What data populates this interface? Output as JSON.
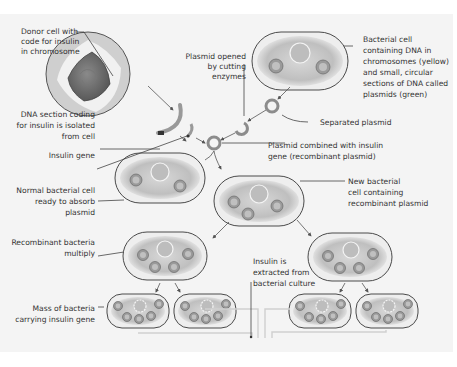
{
  "diagram": {
    "labels": {
      "donor_cell": [
        "Donor cell with",
        "code for insulin",
        "in chromosome"
      ],
      "plasmid_opened": [
        "Plasmid opened",
        "by cutting",
        "enzymes"
      ],
      "bacterial_cell": [
        "Bacterial cell",
        "containing DNA in",
        "chromosomes (yellow)",
        "and small, circular",
        "sections of DNA called",
        "plasmids (green)"
      ],
      "separated_plasmid": [
        "Separated plasmid"
      ],
      "dna_section": [
        "DNA section coding",
        "for insulin is isolated",
        "from cell"
      ],
      "insulin_gene": [
        "Insulin gene"
      ],
      "plasmid_combined": [
        "Plasmid combined with insulin",
        "gene (recombinant plasmid)"
      ],
      "normal_cell": [
        "Normal bacterial cell",
        "ready to absorb",
        "plasmid"
      ],
      "new_cell": [
        "New bacterial",
        "cell containing",
        "recombinant plasmid"
      ],
      "recombinant_multiply": [
        "Recombinant bacteria",
        "multiply"
      ],
      "insulin_extracted": [
        "Insulin is",
        "extracted from",
        "bacterial culture"
      ],
      "mass_of_bacteria": [
        "Mass of bacteria",
        "carrying insulin gene"
      ]
    },
    "colors": {
      "panel_background": "#f4f4f4",
      "outline": "#4a4a4a",
      "text": "#333333"
    }
  }
}
